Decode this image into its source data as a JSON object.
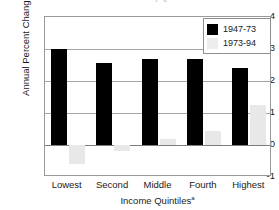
{
  "chart_data": {
    "type": "bar",
    "title": "Income Growth by Quintile",
    "xlabel": "Income Quintiles",
    "xlabel_note": "a",
    "ylabel": "Annual Percent Change",
    "ylim": [
      -1,
      4
    ],
    "yticks": [
      "4",
      "3",
      "2",
      "1",
      "0",
      "-1"
    ],
    "ytick_values": [
      4,
      3,
      2,
      1,
      0,
      -1
    ],
    "grid": true,
    "legend_position": "top-right",
    "categories": [
      "Lowest",
      "Second",
      "Middle",
      "Fourth",
      "Highest"
    ],
    "series": [
      {
        "name": "1947-73",
        "color": "#000000",
        "values": [
          3.0,
          2.57,
          2.7,
          2.7,
          2.4
        ]
      },
      {
        "name": "1973-94",
        "color": "#e8e8e8",
        "values": [
          -0.6,
          -0.2,
          0.18,
          0.45,
          1.25
        ]
      }
    ]
  }
}
